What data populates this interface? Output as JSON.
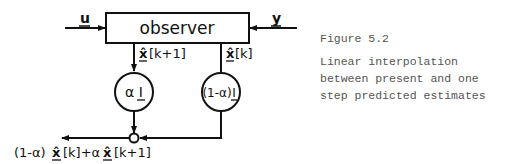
{
  "diagram": {
    "blocks": {
      "observer": "observer",
      "gain_alpha": "α I",
      "gain_one_minus_alpha_prefix": "(1-α)",
      "gain_one_minus_alpha_matrix": "I"
    },
    "signals": {
      "input_u": "u",
      "input_y": "y",
      "predicted_estimate_hat": "x̂",
      "predicted_estimate_index": "[k+1]",
      "present_estimate_hat": "x̂",
      "present_estimate_index": "[k]",
      "output_prefix": "(1-α)",
      "output_x1": "x̂",
      "output_mid": "[k]+α",
      "output_x2": "x̂",
      "output_suffix": "[k+1]"
    }
  },
  "caption": {
    "figure_number": "Figure 5.2",
    "lines": [
      "Linear interpolation",
      "between present and one",
      "step predicted estimates"
    ]
  }
}
